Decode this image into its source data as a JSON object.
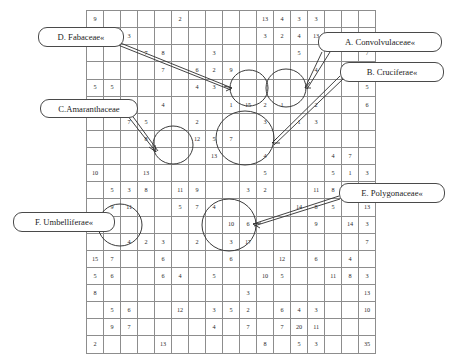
{
  "figure": {
    "kind": "annotated-number-grid",
    "columns": 17,
    "rows": 15
  },
  "chart_data": {
    "type": "table",
    "title": "",
    "xlabel": "",
    "ylabel": "",
    "columns": 17,
    "rows": 15,
    "note": "Sparse numeric grid; empty string means blank cell",
    "cells": [
      [
        "9",
        "",
        "",
        "",
        "",
        "2",
        "",
        "",
        "",
        "",
        "13",
        "4",
        "3",
        "3",
        "",
        "",
        "",
        ""
      ],
      [
        "",
        "",
        "3",
        "",
        "",
        "",
        "",
        "",
        "",
        "",
        "3",
        "2",
        "4",
        "13",
        "",
        "5",
        "",
        ""
      ],
      [
        "",
        "",
        "",
        "7",
        "8",
        "",
        "",
        "3",
        "",
        "",
        "",
        "",
        "5",
        "",
        "",
        "",
        "7",
        ""
      ],
      [
        "",
        "",
        "",
        "",
        "7",
        "",
        "6",
        "2",
        "9",
        "",
        "",
        "",
        "",
        "4",
        "",
        "",
        "",
        ""
      ],
      [
        "5",
        "5",
        "",
        "",
        "",
        "",
        "4",
        "3",
        "",
        "",
        "",
        "",
        "",
        "",
        "",
        "",
        "5",
        ""
      ],
      [
        "6",
        "",
        "",
        "",
        "4",
        "",
        "",
        "",
        "1",
        "15",
        "2",
        "1",
        "",
        "2",
        "",
        "",
        "6",
        ""
      ],
      [
        "",
        "",
        "7",
        "5",
        "",
        "",
        "2",
        "",
        "",
        "",
        "3",
        "",
        "1",
        "3",
        "",
        "",
        "",
        ""
      ],
      [
        "",
        "",
        "",
        "8",
        "",
        "",
        "12",
        "5",
        "7",
        "",
        "",
        "",
        "",
        "",
        "",
        "",
        ""
      ],
      [
        "",
        "",
        "",
        "",
        "",
        "",
        "",
        "13",
        "",
        "",
        "4",
        "",
        "",
        "",
        "4",
        "7",
        "",
        ""
      ],
      [
        "10",
        "",
        "",
        "13",
        "",
        "",
        "",
        "",
        "",
        "",
        "5",
        "",
        "",
        "",
        "5",
        "1",
        "3",
        ""
      ],
      [
        "",
        "5",
        "3",
        "8",
        "",
        "11",
        "9",
        "",
        "",
        "3",
        "2",
        "",
        "",
        "11",
        "8",
        "",
        "",
        ""
      ],
      [
        "",
        "9",
        "11",
        "",
        "",
        "5",
        "7",
        "4",
        "",
        "",
        "",
        "",
        "14",
        "8",
        "5",
        "",
        "13",
        ""
      ],
      [
        "",
        "7",
        "",
        "",
        "",
        "",
        "",
        "",
        "10",
        "6",
        "",
        "",
        "",
        "9",
        "",
        "14",
        "3",
        ""
      ],
      [
        "",
        "",
        "4",
        "2",
        "3",
        "",
        "2",
        "",
        "3",
        "17",
        "",
        "",
        "",
        "",
        "",
        "",
        "7",
        ""
      ],
      [
        "15",
        "7",
        "",
        "",
        "6",
        "",
        "",
        "",
        "6",
        "",
        "",
        "12",
        "",
        "6",
        "",
        "4",
        "",
        ""
      ],
      [
        "5",
        "6",
        "",
        "",
        "6",
        "4",
        "",
        "5",
        "",
        "",
        "10",
        "5",
        "",
        "",
        "11",
        "8",
        "3",
        ""
      ],
      [
        "8",
        "",
        "",
        "",
        "",
        "",
        "",
        "",
        "",
        "3",
        "",
        "",
        "",
        "",
        "",
        "",
        "13",
        ""
      ],
      [
        "",
        "5",
        "6",
        "",
        "",
        "12",
        "",
        "3",
        "5",
        "2",
        "",
        "6",
        "4",
        "3",
        "",
        "",
        "10",
        ""
      ],
      [
        "",
        "9",
        "7",
        "",
        "",
        "",
        "",
        "4",
        "",
        "7",
        "",
        "7",
        "20",
        "11",
        "",
        "",
        "",
        ""
      ],
      [
        "2",
        "",
        "",
        "",
        "13",
        "",
        "",
        "",
        "",
        "",
        "8",
        "",
        "5",
        "3",
        "",
        "",
        "35",
        ""
      ]
    ]
  },
  "callouts": [
    {
      "id": "a",
      "label": "A. Convolvulaceae«",
      "target": "circle-a"
    },
    {
      "id": "b",
      "label": "B. Cruciferae«",
      "target": "circle-b"
    },
    {
      "id": "c",
      "label": "C.Amaranthaceae",
      "target": "circle-c"
    },
    {
      "id": "d",
      "label": "D. Fabaceae«",
      "target": "circle-d"
    },
    {
      "id": "e",
      "label": "E. Polygonaceae«",
      "target": "circle-e"
    },
    {
      "id": "f",
      "label": "F. Umbelliferae«",
      "target": "circle-f"
    }
  ],
  "colors": {
    "ink": "#1d1d1d",
    "grid_line": "#8d8d8d",
    "callout_border": "#4a4a4a",
    "background": "#ffffff"
  }
}
